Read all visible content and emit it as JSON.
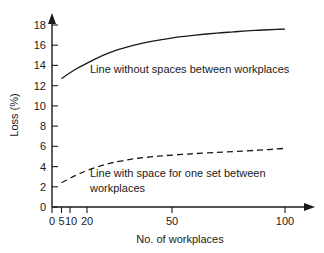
{
  "chart_data": {
    "type": "line",
    "title": "",
    "xlabel": "No. of workplaces",
    "ylabel": "Loss (%)",
    "xscale": "log",
    "xlim": [
      4,
      105
    ],
    "ylim": [
      0,
      19
    ],
    "xticks": [
      0,
      5,
      10,
      20,
      50,
      100
    ],
    "xtick_labels": [
      "0",
      "5",
      "10",
      "20",
      "50",
      "100"
    ],
    "yticks": [
      0,
      2,
      4,
      6,
      8,
      10,
      12,
      14,
      16,
      18
    ],
    "ytick_labels": [
      "0",
      "2",
      "4",
      "6",
      "8",
      "10",
      "12",
      "14",
      "16",
      "18"
    ],
    "grid": false,
    "legend_position": "inline-annotations",
    "axis_arrows": true,
    "series": [
      {
        "name": "Line without spaces between workplaces",
        "style": "solid",
        "color": "#1a1a1a",
        "x": [
          5,
          6,
          7,
          8,
          9,
          10,
          12,
          14,
          17,
          20,
          25,
          30,
          40,
          50,
          60,
          70,
          80,
          90,
          100
        ],
        "values": [
          12.7,
          13.6,
          14.2,
          14.7,
          15.1,
          15.4,
          15.8,
          16.1,
          16.4,
          16.6,
          16.85,
          17.0,
          17.2,
          17.32,
          17.42,
          17.48,
          17.53,
          17.57,
          17.6
        ]
      },
      {
        "name": "Line with space for one set between workplaces",
        "style": "dashed",
        "color": "#1a1a1a",
        "x": [
          5,
          6,
          7,
          8,
          9,
          10,
          12,
          14,
          17,
          20,
          25,
          30,
          40,
          50,
          60,
          70,
          80,
          90,
          100
        ],
        "values": [
          2.4,
          3.1,
          3.6,
          3.95,
          4.2,
          4.4,
          4.65,
          4.82,
          4.98,
          5.08,
          5.2,
          5.28,
          5.4,
          5.48,
          5.55,
          5.62,
          5.68,
          5.74,
          5.8
        ]
      }
    ],
    "annotations": [
      {
        "id": "annotation-solid",
        "lines": [
          "Line without spaces between workplaces"
        ],
        "x": 90,
        "y": 73
      },
      {
        "id": "annotation-dashed",
        "lines": [
          "Line with space for one set between",
          "workplaces"
        ],
        "x": 90,
        "y": 177
      }
    ]
  }
}
